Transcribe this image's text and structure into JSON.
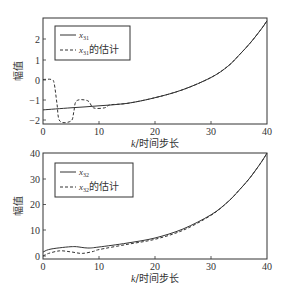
{
  "chart_data": [
    {
      "type": "line",
      "title": "",
      "xlabel": "k/时间步长",
      "ylabel": "幅值",
      "xlim": [
        0,
        40
      ],
      "ylim": [
        -2.2,
        2.9
      ],
      "xticks": [
        0,
        10,
        20,
        30,
        40
      ],
      "yticks": [
        -2,
        -1,
        0,
        1,
        2
      ],
      "grid": false,
      "legend_position": "upper left",
      "legend": [
        "x31",
        "x31的估计"
      ],
      "series": [
        {
          "name": "x31",
          "style": "solid",
          "x": [
            0,
            5,
            10,
            15,
            20,
            25,
            30,
            33,
            35,
            37,
            39,
            40
          ],
          "y": [
            -1.5,
            -1.4,
            -1.3,
            -1.18,
            -0.9,
            -0.5,
            0.1,
            0.65,
            1.2,
            1.8,
            2.5,
            2.9
          ]
        },
        {
          "name": "x31的估计",
          "style": "dashed",
          "x": [
            0,
            1.5,
            2,
            2.5,
            3,
            5,
            5.5,
            6,
            8,
            9,
            11,
            12,
            15,
            20,
            25,
            30,
            33,
            35,
            37,
            39,
            40
          ],
          "y": [
            0,
            0,
            -0.2,
            -1.2,
            -2.05,
            -2.05,
            -1.6,
            -1.05,
            -1.05,
            -1.4,
            -1.4,
            -1.25,
            -1.18,
            -0.9,
            -0.5,
            0.1,
            0.65,
            1.2,
            1.8,
            2.5,
            2.9
          ]
        }
      ]
    },
    {
      "type": "line",
      "title": "",
      "xlabel": "k/时间步长",
      "ylabel": "幅值",
      "xlim": [
        0,
        40
      ],
      "ylim": [
        -1,
        40
      ],
      "xticks": [
        0,
        10,
        20,
        30,
        40
      ],
      "yticks": [
        0,
        10,
        20,
        30,
        40
      ],
      "grid": false,
      "legend_position": "upper left",
      "legend": [
        "x32",
        "x32的估计"
      ],
      "series": [
        {
          "name": "x32",
          "style": "solid",
          "x": [
            0,
            1,
            3,
            5,
            6,
            8,
            10,
            15,
            20,
            25,
            30,
            33,
            35,
            37,
            39,
            40
          ],
          "y": [
            1.5,
            2.5,
            3.2,
            3.6,
            3.6,
            3.1,
            3.5,
            5,
            7,
            10.5,
            16,
            21,
            25.5,
            30.5,
            36.5,
            40
          ]
        },
        {
          "name": "x32的估计",
          "style": "dashed",
          "x": [
            0,
            1,
            3,
            5,
            7,
            9,
            10,
            15,
            20,
            25,
            30,
            33,
            35,
            37,
            39,
            40
          ],
          "y": [
            0,
            1,
            2,
            1.6,
            1,
            1.8,
            2.5,
            4.5,
            6.5,
            10,
            15.8,
            21,
            25.5,
            30.5,
            36.5,
            40
          ]
        }
      ]
    }
  ],
  "plots": [
    {
      "ylabel": "幅值",
      "xlabel_k": "k",
      "xlabel_rest": "/时间步长",
      "xtick_labels": [
        "0",
        "10",
        "20",
        "30",
        "40"
      ],
      "ytick_labels": [
        "−2",
        "−1",
        "0",
        "1",
        "2"
      ],
      "legend_true_main": "x",
      "legend_true_sub": "31",
      "legend_est_main": "x",
      "legend_est_sub": "31",
      "legend_est_suffix": "的估计"
    },
    {
      "ylabel": "幅值",
      "xlabel_k": "k",
      "xlabel_rest": "/时间步长",
      "xtick_labels": [
        "0",
        "10",
        "20",
        "30",
        "40"
      ],
      "ytick_labels": [
        "0",
        "10",
        "20",
        "30",
        "40"
      ],
      "legend_true_main": "x",
      "legend_true_sub": "32",
      "legend_est_main": "x",
      "legend_est_sub": "32",
      "legend_est_suffix": "的估计"
    }
  ]
}
